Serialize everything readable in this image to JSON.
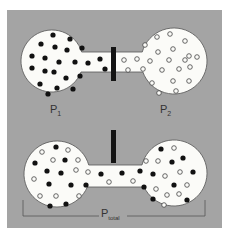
{
  "colors": {
    "page_bg": "#ffffff",
    "panel_bg": "#a4a4a4",
    "vessel_fill": "#fbfbf8",
    "vessel_stroke": "#555555",
    "particle_filled": "#111111",
    "particle_open_stroke": "#444444",
    "barrier": "#141414",
    "bracket": "#555555"
  },
  "panel": {
    "x": 7,
    "y": 10,
    "w": 215,
    "h": 218
  },
  "top_state": {
    "description": "Two bulbs separated by closed barrier",
    "left_bulb": {
      "cx": 52,
      "cy": 61,
      "r": 31
    },
    "right_bulb": {
      "cx": 174,
      "cy": 61,
      "r": 33
    },
    "channel": {
      "x1": 76,
      "x2": 144,
      "y1": 52,
      "y2": 72
    },
    "barrier": {
      "x": 111,
      "y": 47,
      "w": 5,
      "h": 34
    },
    "label_left": {
      "main": "P",
      "sub": "1",
      "x": 50,
      "y": 113
    },
    "label_right": {
      "main": "P",
      "sub": "2",
      "x": 160,
      "y": 113
    },
    "filled_particles": [
      [
        53,
        35
      ],
      [
        70,
        39
      ],
      [
        41,
        44
      ],
      [
        55,
        47
      ],
      [
        67,
        50
      ],
      [
        82,
        48
      ],
      [
        32,
        56
      ],
      [
        45,
        58
      ],
      [
        59,
        62
      ],
      [
        75,
        62
      ],
      [
        88,
        63
      ],
      [
        100,
        59
      ],
      [
        32,
        68
      ],
      [
        45,
        71
      ],
      [
        54,
        72
      ],
      [
        66,
        78
      ],
      [
        80,
        76
      ],
      [
        40,
        84
      ],
      [
        57,
        88
      ],
      [
        73,
        89
      ],
      [
        48,
        94
      ],
      [
        105,
        69
      ]
    ],
    "open_particles": [
      [
        170,
        34
      ],
      [
        157,
        37
      ],
      [
        185,
        41
      ],
      [
        145,
        45
      ],
      [
        173,
        49
      ],
      [
        158,
        52
      ],
      [
        189,
        56
      ],
      [
        124,
        60
      ],
      [
        137,
        59
      ],
      [
        150,
        61
      ],
      [
        169,
        60
      ],
      [
        185,
        60
      ],
      [
        197,
        57
      ],
      [
        128,
        70
      ],
      [
        143,
        69
      ],
      [
        162,
        70
      ],
      [
        179,
        69
      ],
      [
        190,
        67
      ],
      [
        152,
        83
      ],
      [
        173,
        81
      ],
      [
        189,
        81
      ],
      [
        159,
        93
      ],
      [
        176,
        91
      ]
    ]
  },
  "bottom_state": {
    "description": "Barrier lifted, particles mixed",
    "left_bulb": {
      "cx": 57,
      "cy": 174,
      "r": 33
    },
    "right_bulb": {
      "cx": 174,
      "cy": 173,
      "r": 33
    },
    "channel": {
      "x1": 82,
      "x2": 146,
      "y1": 165,
      "y2": 187
    },
    "barrier": {
      "x": 111,
      "y": 130,
      "w": 5,
      "h": 33
    },
    "bracket": {
      "x1": 23,
      "x2": 205,
      "y": 216,
      "tick_top": 200
    },
    "label_total": {
      "main": "P",
      "sub": "total",
      "x": 101,
      "y": 217
    },
    "filled_particles": [
      [
        56,
        147
      ],
      [
        35,
        163
      ],
      [
        65,
        160
      ],
      [
        47,
        171
      ],
      [
        61,
        173
      ],
      [
        49,
        184
      ],
      [
        71,
        185
      ],
      [
        86,
        185
      ],
      [
        50,
        206
      ],
      [
        66,
        204
      ],
      [
        101,
        174
      ],
      [
        122,
        173
      ],
      [
        161,
        149
      ],
      [
        183,
        158
      ],
      [
        172,
        162
      ],
      [
        140,
        171
      ],
      [
        153,
        174
      ],
      [
        193,
        172
      ],
      [
        144,
        187
      ],
      [
        174,
        185
      ],
      [
        153,
        199
      ],
      [
        187,
        200
      ]
    ],
    "open_particles": [
      [
        42,
        152
      ],
      [
        68,
        150
      ],
      [
        53,
        160
      ],
      [
        78,
        160
      ],
      [
        76,
        170
      ],
      [
        88,
        172
      ],
      [
        34,
        179
      ],
      [
        40,
        196
      ],
      [
        56,
        196
      ],
      [
        79,
        196
      ],
      [
        109,
        182
      ],
      [
        133,
        181
      ],
      [
        174,
        148
      ],
      [
        146,
        161
      ],
      [
        158,
        161
      ],
      [
        165,
        176
      ],
      [
        180,
        172
      ],
      [
        187,
        185
      ],
      [
        156,
        189
      ],
      [
        167,
        195
      ],
      [
        179,
        194
      ],
      [
        164,
        205
      ]
    ]
  }
}
